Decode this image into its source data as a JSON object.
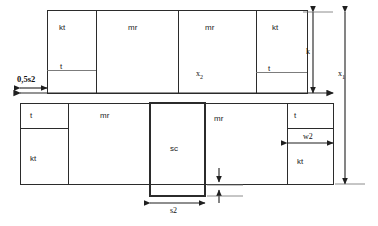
{
  "diagram": {
    "background": "#ffffff",
    "line_color": "#2b2b2b",
    "top_row": {
      "cells": [
        {
          "id": "top-kt-left",
          "label": "kt",
          "has_t_marker": true,
          "t_label": "t"
        },
        {
          "id": "top-mr-1",
          "label": "mr",
          "has_t_marker": false,
          "t_label": ""
        },
        {
          "id": "top-mr-2",
          "label": "mr",
          "has_t_marker": false,
          "t_label": ""
        },
        {
          "id": "top-kt-right",
          "label": "kt",
          "has_t_marker": true,
          "t_label": "t"
        }
      ],
      "inner_label": "x",
      "inner_label_sub": "2"
    },
    "bottom_row": {
      "cells": [
        {
          "id": "bot-t-kt",
          "label_top": "t",
          "label_bottom": "kt"
        },
        {
          "id": "bot-mr-1",
          "label_top": "",
          "label_bottom": "mr"
        },
        {
          "id": "bot-sc",
          "label_top": "",
          "label_bottom": "sc"
        },
        {
          "id": "bot-mr-2",
          "label_top": "",
          "label_bottom": "mr"
        },
        {
          "id": "bot-t-kt2",
          "label_top": "t",
          "label_bottom": "kt"
        }
      ]
    },
    "dimensions": [
      {
        "id": "dim-half-s2",
        "label": "0,5s2",
        "orientation": "horizontal",
        "emphasis": "bold"
      },
      {
        "id": "dim-s2",
        "label": "s2",
        "orientation": "horizontal",
        "emphasis": "normal"
      },
      {
        "id": "dim-w2",
        "label": "w2",
        "orientation": "horizontal",
        "emphasis": "normal"
      },
      {
        "id": "dim-k",
        "label": "k",
        "orientation": "vertical",
        "emphasis": "normal"
      },
      {
        "id": "dim-x1",
        "label": "x",
        "label_sub": "1",
        "orientation": "vertical",
        "emphasis": "normal"
      },
      {
        "id": "dim-span",
        "label": "",
        "orientation": "horizontal",
        "emphasis": "normal"
      }
    ]
  }
}
